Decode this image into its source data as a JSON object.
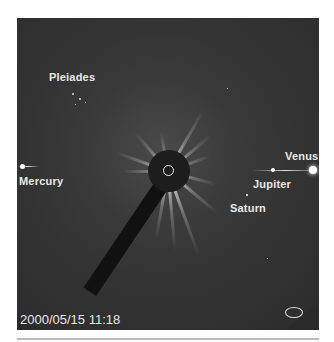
{
  "image": {
    "description": "LASCO coronagraph view with occulting disk showing planets and Pleiades",
    "timestamp": "2000/05/15 11:18",
    "labels": {
      "pleiades": "Pleiades",
      "mercury": "Mercury",
      "venus": "Venus",
      "jupiter": "Jupiter",
      "saturn": "Saturn"
    },
    "logo_icon": "soho-lasco-logo-icon"
  }
}
